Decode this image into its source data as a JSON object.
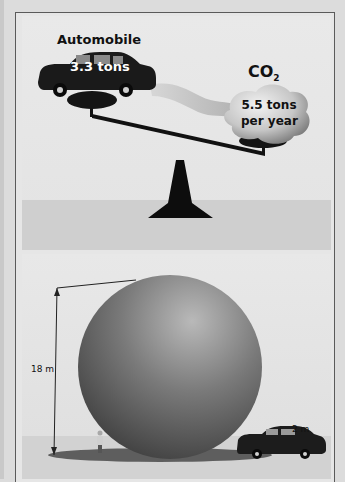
{
  "figure": {
    "top_panel": {
      "title": "Automobile",
      "car_weight": "3.3 tons",
      "gas_label_main": "CO",
      "gas_label_sub": "2",
      "cloud_line1": "5.5 tons",
      "cloud_line2": "per year",
      "icons": [
        "car-icon",
        "cloud-icon",
        "seesaw-icon"
      ]
    },
    "bottom_panel": {
      "sphere_height_label": "18 m",
      "car_height_label": "2 m",
      "icons": [
        "sphere-icon",
        "person-icon",
        "car-icon",
        "dimension-arrow-icon"
      ]
    },
    "colors": {
      "background": "#e6e6e6",
      "ground": "#cfcfcf",
      "ink": "#111111",
      "frame_border": "#5a5a5a"
    }
  }
}
